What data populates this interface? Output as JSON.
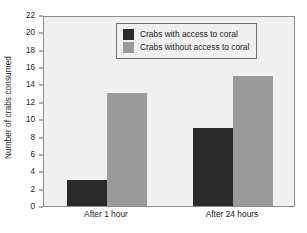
{
  "chart_data": {
    "type": "bar",
    "title": "",
    "xlabel": "",
    "ylabel": "Number of crabs consumed",
    "categories": [
      "After 1 hour",
      "After 24 hours"
    ],
    "series": [
      {
        "name": "Crabs with access to coral",
        "values": [
          3,
          9
        ],
        "color": "#2a2a2a"
      },
      {
        "name": "Crabs without access to coral",
        "values": [
          13,
          15
        ],
        "color": "#9a9a9a"
      }
    ],
    "ylim": [
      0,
      22
    ],
    "ytick_step": 2,
    "yticks": [
      0,
      2,
      4,
      6,
      8,
      10,
      12,
      14,
      16,
      18,
      20,
      22
    ],
    "ytick_labels": [
      "0",
      "2",
      "4",
      "6",
      "8",
      "10",
      "12",
      "14",
      "16",
      "18",
      "20",
      "22"
    ],
    "grid": false,
    "legend_position": "top-center",
    "plot_background": "#f0f0f0",
    "frame_color": "#8c8c8c"
  },
  "legend": {
    "entries": [
      {
        "label": "Crabs with access to coral"
      },
      {
        "label": "Crabs without access to coral"
      }
    ]
  }
}
